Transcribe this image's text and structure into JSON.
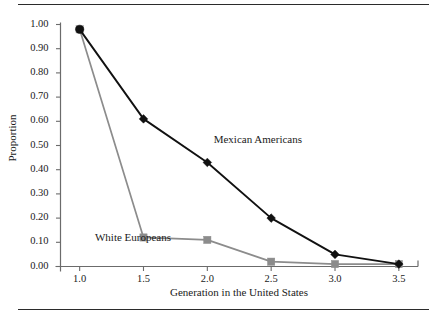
{
  "figure": {
    "top_rule": "divider",
    "bottom_rule": "divider"
  },
  "chart_data": {
    "type": "line",
    "title": "",
    "xlabel": "Generation in the United States",
    "ylabel": "Proportion",
    "x": [
      1.0,
      1.5,
      2.0,
      2.5,
      3.0,
      3.5
    ],
    "xtick_labels": [
      "1.0",
      "1.5",
      "2.0",
      "2.5",
      "3.0",
      "3.5"
    ],
    "ytick_labels": [
      "0.00",
      "0.10",
      "0.20",
      "0.30",
      "0.40",
      "0.50",
      "0.60",
      "0.70",
      "0.80",
      "0.90",
      "1.00"
    ],
    "ytick_values": [
      0.0,
      0.1,
      0.2,
      0.3,
      0.4,
      0.5,
      0.6,
      0.7,
      0.8,
      0.9,
      1.0
    ],
    "xlim": [
      0.85,
      3.65
    ],
    "ylim": [
      0.0,
      1.0
    ],
    "grid": false,
    "legend": "inline-annotations",
    "series": [
      {
        "name": "Mexican Americans",
        "color": "#111111",
        "marker": "diamond",
        "values": [
          0.98,
          0.61,
          0.43,
          0.2,
          0.05,
          0.01
        ],
        "label_x": 2.05,
        "label_y": 0.52
      },
      {
        "name": "White Europeans",
        "color": "#8c8c8c",
        "marker": "square",
        "values": [
          0.98,
          0.12,
          0.11,
          0.02,
          0.01,
          0.01
        ],
        "label_x": 1.12,
        "label_y": 0.115
      }
    ]
  }
}
